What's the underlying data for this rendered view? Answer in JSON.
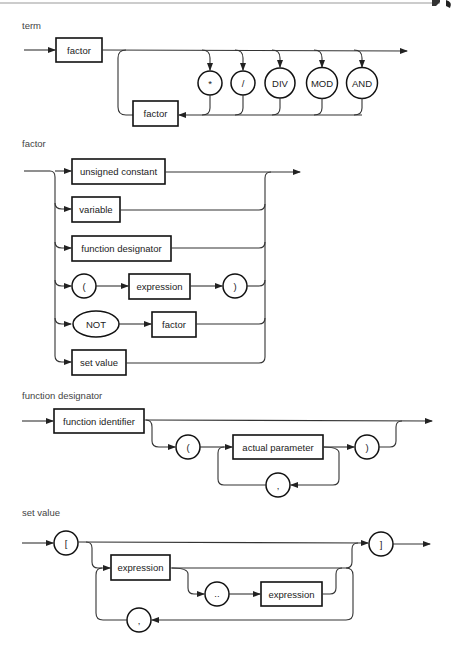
{
  "page": {
    "top_rule_color": "#9a9a9a",
    "ink_color": "#222222"
  },
  "diagrams": {
    "term": {
      "title": "term",
      "nodes": {
        "factor_main": "factor",
        "op_mul": "*",
        "op_div_slash": "/",
        "op_div": "DIV",
        "op_mod": "MOD",
        "op_and": "AND",
        "factor_loop": "factor"
      }
    },
    "factor": {
      "title": "factor",
      "alternatives": [
        [
          "unsigned constant"
        ],
        [
          "variable"
        ],
        [
          "function designator"
        ],
        [
          "(",
          "expression",
          ")"
        ],
        [
          "NOT",
          "factor"
        ],
        [
          "set value"
        ]
      ],
      "nodes": {
        "unsigned_constant": "unsigned constant",
        "variable": "variable",
        "function_designator": "function designator",
        "lparen": "(",
        "expression": "expression",
        "rparen": ")",
        "not": "NOT",
        "factor": "factor",
        "set_value": "set value"
      }
    },
    "function_designator": {
      "title": "function designator",
      "nodes": {
        "function_identifier": "function identifier",
        "lparen": "(",
        "actual_parameter": "actual parameter",
        "rparen": ")",
        "comma": ","
      }
    },
    "set_value": {
      "title": "set value",
      "nodes": {
        "lbracket": "[",
        "expression_1": "expression",
        "range": "..",
        "expression_2": "expression",
        "comma": ",",
        "rbracket": "]"
      }
    }
  }
}
